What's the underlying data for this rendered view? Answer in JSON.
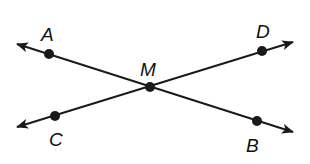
{
  "diagram": {
    "stroke_color": "#1a1a1a",
    "lines": [
      {
        "name": "line-AB",
        "from": [
          17,
          44
        ],
        "to": [
          293,
          132
        ]
      },
      {
        "name": "line-CD",
        "from": [
          17,
          127
        ],
        "to": [
          293,
          42
        ]
      }
    ],
    "points": [
      {
        "id": "A",
        "label": "A",
        "x": 49,
        "y": 54,
        "label_x": 41,
        "label_y": 41
      },
      {
        "id": "M",
        "label": "M",
        "x": 150,
        "y": 87,
        "label_x": 140,
        "label_y": 76
      },
      {
        "id": "D",
        "label": "D",
        "x": 262,
        "y": 51,
        "label_x": 256,
        "label_y": 38
      },
      {
        "id": "C",
        "label": "C",
        "x": 55,
        "y": 116,
        "label_x": 49,
        "label_y": 146
      },
      {
        "id": "B",
        "label": "B",
        "x": 257,
        "y": 121,
        "label_x": 246,
        "label_y": 152
      }
    ]
  }
}
